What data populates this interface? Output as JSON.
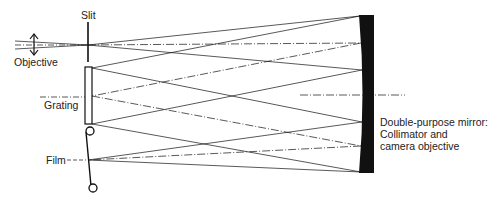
{
  "diagram": {
    "type": "optical-schematic",
    "labels": {
      "slit": "Slit",
      "objective": "Objective",
      "grating": "Grating",
      "film": "Film",
      "mirror_line1": "Double-purpose mirror:",
      "mirror_line2": "Collimator and",
      "mirror_line3": "camera objective"
    },
    "colors": {
      "ink": "#111111",
      "background": "#ffffff"
    }
  }
}
